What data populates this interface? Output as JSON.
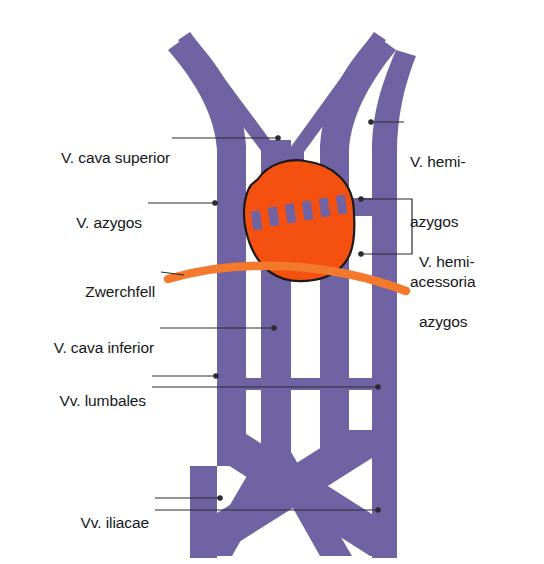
{
  "figure": {
    "colors": {
      "vein_purple": "#6f63a3",
      "vein_purple_dark": "#5f5494",
      "organ_orange": "#f4500f",
      "diaphragm_orange": "#f4792c",
      "outline_black": "#1a1a1a",
      "leader_line": "#2b2b30",
      "background": "#ffffff",
      "text": "#16161a"
    },
    "labels": {
      "cava_superior": "V. cava superior",
      "azygos": "V. azygos",
      "zwerchfell": "Zwerchfell",
      "cava_inferior": "V. cava inferior",
      "lumbales": "Vv. lumbales",
      "iliacae": "Vv. iliacae",
      "hemiazygos_acessoria_line1": "V. hemi-",
      "hemiazygos_acessoria_line2": "azygos",
      "hemiazygos_acessoria_line3": "acessoria",
      "hemiazygos_line1": "V. hemi-",
      "hemiazygos_line2": "azygos"
    },
    "structures": {
      "vena_cava_superior": "vena-cava-superior",
      "vena_azygos": "vena-azygos",
      "vena_hemiazygos": "vena-hemiazygos",
      "vena_hemiazygos_acessoria": "vena-hemiazygos-acessoria",
      "vena_cava_inferior": "vena-cava-inferior",
      "venae_lumbales": "venae-lumbales",
      "venae_iliacae": "venae-iliacae",
      "diaphragm": "zwerchfell-diaphragma",
      "organ": "oesophagus-organ-mass",
      "anastomoses": "lumbale-anastomosen-striche"
    }
  }
}
